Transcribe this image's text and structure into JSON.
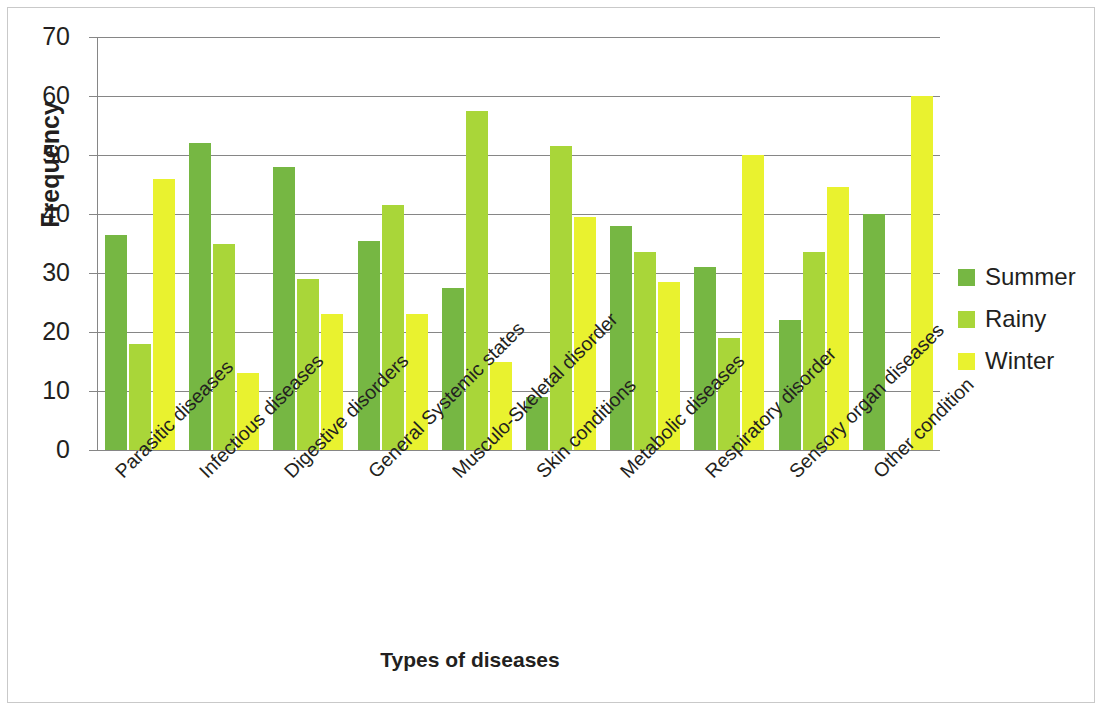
{
  "chart_data": {
    "type": "bar",
    "title": "",
    "subtitle": "",
    "xlabel": "Types of diseases",
    "ylabel": "Frequency",
    "ylim": [
      0,
      70
    ],
    "ytick_step": 10,
    "yticks": [
      0,
      10,
      20,
      30,
      40,
      50,
      60,
      70
    ],
    "grid": true,
    "grid_axis": "y",
    "legend_position": "right",
    "orientation": "vertical",
    "grouping": "grouped",
    "categories": [
      "Parasitic diseases",
      "Infectious diseases",
      "Digestive disorders",
      "General Systemic states",
      "Musculo-Skeletal disorder",
      "Skin conditions",
      "Metabolic diseases",
      "Respiratory disorder",
      "Sensory organ diseases",
      "Other condition"
    ],
    "series": [
      {
        "name": "Summer",
        "color": "#76b743",
        "values": [
          36.5,
          52,
          48,
          35.5,
          27.5,
          9,
          38,
          31,
          22,
          40
        ]
      },
      {
        "name": "Rainy",
        "color": "#a9d639",
        "values": [
          18,
          35,
          29,
          41.5,
          57.5,
          51.5,
          33.5,
          19,
          33.5,
          0
        ]
      },
      {
        "name": "Winter",
        "color": "#e9f22f",
        "values": [
          46,
          13,
          23,
          23,
          15,
          39.5,
          28.5,
          50,
          44.5,
          60
        ]
      }
    ]
  },
  "legend": {
    "items": [
      {
        "label": "Summer",
        "color": "#76b743"
      },
      {
        "label": "Rainy",
        "color": "#a9d639"
      },
      {
        "label": "Winter",
        "color": "#e9f22f"
      }
    ]
  },
  "axes": {
    "y_title": "Frequency",
    "x_title": "Types of diseases"
  }
}
